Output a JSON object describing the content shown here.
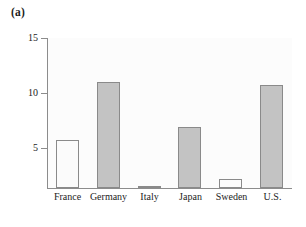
{
  "figure": {
    "panel_label": "(a)"
  },
  "chart_data": {
    "type": "bar",
    "title": "",
    "subtitle": "",
    "xlabel": "",
    "ylabel": "",
    "categories": [
      "France",
      "Germany",
      "Italy",
      "Japan",
      "Sweden",
      "U.S."
    ],
    "values": [
      5.7,
      11.0,
      1.2,
      6.9,
      2.2,
      10.7
    ],
    "series": [
      {
        "name": "",
        "values": [
          5.7,
          11.0,
          1.2,
          6.9,
          2.2,
          10.7
        ]
      }
    ],
    "bar_fills": [
      "light",
      "dark",
      "light",
      "dark",
      "light",
      "dark"
    ],
    "ylim": [
      0,
      15
    ],
    "y_ticks": [
      5,
      10,
      15
    ],
    "y_tick_labels": [
      "5",
      "10",
      "15"
    ],
    "grid": false,
    "legend": false,
    "legend_position": "none",
    "annotations": []
  },
  "colors": {
    "bar_light_fill": "#fbfbfb",
    "bar_dark_fill": "#c3c3c3",
    "bar_edge": "#8a8a8a",
    "axis": "#8c8c8c",
    "plot_background": "#fcfcfc",
    "page_background": "#ffffff",
    "text": "#1c1c1c"
  }
}
